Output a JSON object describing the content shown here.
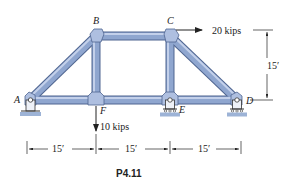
{
  "figure": {
    "caption": "P4.11",
    "colors": {
      "member_fill": "#8fa6cf",
      "member_edge": "#4f6590",
      "member_highlight": "#c3d0ea",
      "gusset": "#aebfe0",
      "ground": "#9db3d6",
      "line": "#222222"
    }
  },
  "joints": {
    "A": {
      "label": "A",
      "x": 30,
      "y": 100
    },
    "B": {
      "label": "B",
      "x": 96,
      "y": 36
    },
    "C": {
      "label": "C",
      "x": 170,
      "y": 36
    },
    "D": {
      "label": "D",
      "x": 237,
      "y": 100
    },
    "E": {
      "label": "E",
      "x": 170,
      "y": 100
    },
    "F": {
      "label": "F",
      "x": 96,
      "y": 100
    }
  },
  "members": [
    [
      "A",
      "B"
    ],
    [
      "B",
      "C"
    ],
    [
      "C",
      "D"
    ],
    [
      "A",
      "F"
    ],
    [
      "F",
      "E"
    ],
    [
      "E",
      "D"
    ],
    [
      "B",
      "F"
    ],
    [
      "C",
      "E"
    ]
  ],
  "supports": [
    {
      "joint": "A",
      "type": "pin"
    },
    {
      "joint": "E",
      "type": "roller"
    },
    {
      "joint": "D",
      "type": "roller"
    }
  ],
  "loads": [
    {
      "joint": "C",
      "label": "20 kips",
      "direction": "right"
    },
    {
      "joint": "F",
      "label": "10 kips",
      "direction": "down"
    }
  ],
  "dimensions": {
    "horizontal": [
      "15′",
      "15′",
      "15′"
    ],
    "vertical": "15′"
  }
}
